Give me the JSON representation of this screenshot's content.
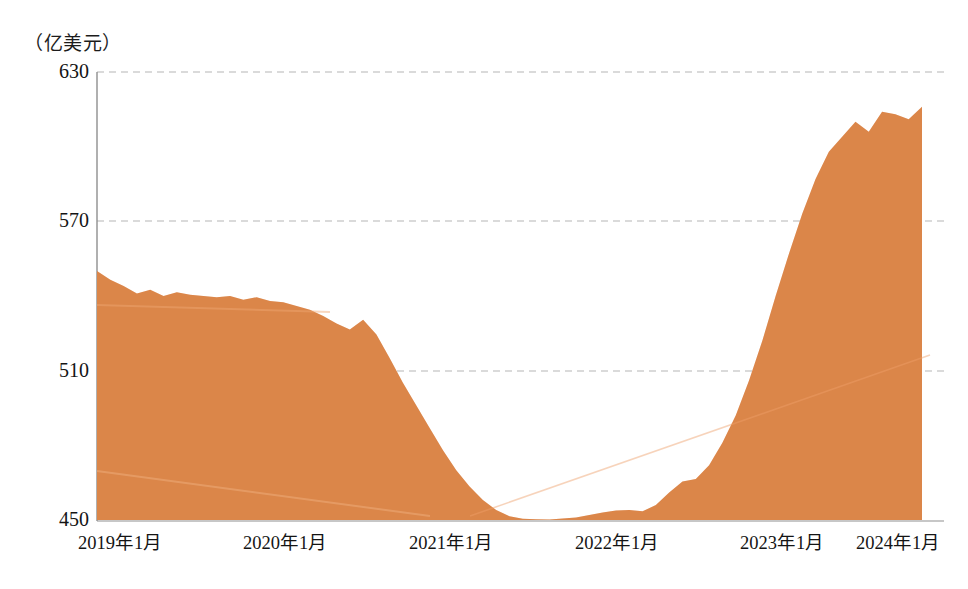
{
  "chart_data": {
    "type": "area",
    "title": "",
    "subtitle": "",
    "unit_label": "（亿美元）",
    "xlabel": "",
    "ylabel": "",
    "ylim": [
      450,
      630
    ],
    "yticks": [
      450,
      510,
      570,
      630
    ],
    "grid": true,
    "legend": null,
    "legend_position": "none",
    "series_color": "#E08A4E",
    "series": [
      {
        "name": "外汇储备",
        "x": [
          "2019年1月",
          "2019年2月",
          "2019年3月",
          "2019年4月",
          "2019年5月",
          "2019年6月",
          "2019年7月",
          "2019年8月",
          "2019年9月",
          "2019年10月",
          "2019年11月",
          "2019年12月",
          "2020年1月",
          "2020年2月",
          "2020年3月",
          "2020年4月",
          "2020年5月",
          "2020年6月",
          "2020年7月",
          "2020年8月",
          "2020年9月",
          "2020年10月",
          "2020年11月",
          "2020年12月",
          "2021年1月",
          "2021年2月",
          "2021年3月",
          "2021年4月",
          "2021年5月",
          "2021年6月",
          "2021年7月",
          "2021年8月",
          "2021年9月",
          "2021年10月",
          "2021年11月",
          "2021年12月",
          "2022年1月",
          "2022年2月",
          "2022年3月",
          "2022年4月",
          "2022年5月",
          "2022年6月",
          "2022年7月",
          "2022年8月",
          "2022年9月",
          "2022年10月",
          "2022年11月",
          "2022年12月",
          "2023年1月",
          "2023年2月",
          "2023年3月",
          "2023年4月",
          "2023年5月",
          "2023年6月",
          "2023年7月",
          "2023年8月",
          "2023年9月",
          "2023年10月",
          "2023年11月",
          "2023年12月",
          "2024年1月",
          "2024年2月",
          "2024年3月"
        ],
        "values": [
          550.0,
          546.5,
          544.0,
          541.0,
          542.5,
          540.0,
          541.5,
          540.5,
          540.0,
          539.5,
          540.0,
          538.5,
          539.5,
          538.0,
          537.5,
          536.0,
          534.5,
          532.0,
          529.0,
          526.5,
          530.5,
          524.5,
          515.0,
          505.0,
          496.0,
          487.0,
          478.0,
          470.0,
          463.5,
          458.0,
          454.0,
          451.5,
          450.5,
          450.3,
          450.2,
          450.6,
          451.0,
          452.0,
          453.0,
          453.8,
          454.0,
          453.5,
          456.0,
          461.0,
          465.5,
          466.5,
          472.0,
          481.0,
          492.0,
          506.0,
          522.0,
          540.0,
          557.0,
          573.0,
          587.0,
          598.0,
          604.0,
          610.0,
          606.0,
          614.0,
          613.0,
          611.0,
          616.0
        ]
      }
    ],
    "xtick_labels": [
      "2019年1月",
      "2020年1月",
      "2021年1月",
      "2022年1月",
      "2023年1月",
      "2024年1月"
    ],
    "annotations": []
  },
  "axis": {
    "unit_caption": "（亿美元）",
    "y_labels": [
      "630",
      "570",
      "510",
      "450"
    ],
    "x_labels": [
      "2019年1月",
      "2020年1月",
      "2021年1月",
      "2022年1月",
      "2023年1月",
      "2024年1月"
    ]
  },
  "colors": {
    "area_fill": "#E08A4E",
    "area_fill_light": "#E79A60",
    "axis_line": "#9a9a9a",
    "grid_line": "#b9b9b9",
    "text": "#141414"
  }
}
